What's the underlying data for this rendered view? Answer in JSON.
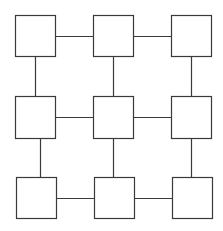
{
  "diagram": {
    "type": "grid-graph",
    "rows": 3,
    "cols": 3,
    "stroke_color": "#3a3a3a",
    "fill_color": "#ffffff",
    "nodes": [
      {
        "id": "n11",
        "row": 1,
        "col": 1,
        "x": 15,
        "y": 15,
        "w": 40,
        "h": 41
      },
      {
        "id": "n12",
        "row": 1,
        "col": 2,
        "x": 93,
        "y": 15,
        "w": 40,
        "h": 41
      },
      {
        "id": "n13",
        "row": 1,
        "col": 3,
        "x": 171,
        "y": 15,
        "w": 40,
        "h": 41
      },
      {
        "id": "n21",
        "row": 2,
        "col": 1,
        "x": 15,
        "y": 96,
        "w": 40,
        "h": 42
      },
      {
        "id": "n22",
        "row": 2,
        "col": 2,
        "x": 93,
        "y": 96,
        "w": 40,
        "h": 42
      },
      {
        "id": "n23",
        "row": 2,
        "col": 3,
        "x": 171,
        "y": 96,
        "w": 40,
        "h": 42
      },
      {
        "id": "n31",
        "row": 3,
        "col": 1,
        "x": 16,
        "y": 177,
        "w": 40,
        "h": 41
      },
      {
        "id": "n32",
        "row": 3,
        "col": 2,
        "x": 94,
        "y": 177,
        "w": 40,
        "h": 41
      },
      {
        "id": "n33",
        "row": 3,
        "col": 3,
        "x": 172,
        "y": 177,
        "w": 40,
        "h": 41
      }
    ],
    "edges": [
      {
        "from": "n11",
        "to": "n12",
        "x1": 55,
        "y1": 36,
        "x2": 93,
        "y2": 36
      },
      {
        "from": "n12",
        "to": "n13",
        "x1": 133,
        "y1": 36,
        "x2": 171,
        "y2": 36
      },
      {
        "from": "n21",
        "to": "n22",
        "x1": 55,
        "y1": 117,
        "x2": 93,
        "y2": 117
      },
      {
        "from": "n22",
        "to": "n23",
        "x1": 133,
        "y1": 117,
        "x2": 171,
        "y2": 117
      },
      {
        "from": "n31",
        "to": "n32",
        "x1": 56,
        "y1": 198,
        "x2": 94,
        "y2": 198
      },
      {
        "from": "n32",
        "to": "n33",
        "x1": 134,
        "y1": 198,
        "x2": 172,
        "y2": 198
      },
      {
        "from": "n11",
        "to": "n21",
        "x1": 35,
        "y1": 56,
        "x2": 35,
        "y2": 96
      },
      {
        "from": "n12",
        "to": "n22",
        "x1": 113,
        "y1": 56,
        "x2": 113,
        "y2": 96
      },
      {
        "from": "n13",
        "to": "n23",
        "x1": 191,
        "y1": 56,
        "x2": 191,
        "y2": 96
      },
      {
        "from": "n21",
        "to": "n31",
        "x1": 40,
        "y1": 138,
        "x2": 40,
        "y2": 177
      },
      {
        "from": "n22",
        "to": "n32",
        "x1": 113,
        "y1": 138,
        "x2": 113,
        "y2": 177
      },
      {
        "from": "n23",
        "to": "n33",
        "x1": 191,
        "y1": 138,
        "x2": 191,
        "y2": 177
      }
    ]
  }
}
